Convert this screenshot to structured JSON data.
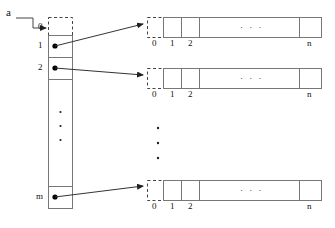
{
  "diagram": {
    "pointer_label": "a",
    "colors": {
      "stroke": "#555555",
      "dash": "#444444",
      "dot": "#000000",
      "text": "#111111"
    },
    "column": {
      "name": "row-pointer-column",
      "header_cell_label": "0",
      "index_labels": [
        "0",
        "1",
        "2",
        "m"
      ],
      "vertical_ellipsis": "·",
      "cells": [
        {
          "index": "0",
          "dashed": true,
          "has_pointer": false
        },
        {
          "index": "1",
          "dashed": false,
          "has_pointer": true
        },
        {
          "index": "2",
          "dashed": false,
          "has_pointer": true
        },
        {
          "index": "",
          "dashed": false,
          "has_pointer": false
        },
        {
          "index": "m",
          "dashed": false,
          "has_pointer": true
        }
      ]
    },
    "rows": [
      {
        "name": "row-array-1",
        "source_index": "1",
        "index_labels": [
          "0",
          "1",
          "2",
          "n"
        ],
        "leading_dashed_cell": true,
        "horizontal_ellipsis": "· · ·"
      },
      {
        "name": "row-array-2",
        "source_index": "2",
        "index_labels": [
          "0",
          "1",
          "2",
          "n"
        ],
        "leading_dashed_cell": true,
        "horizontal_ellipsis": "· · ·"
      },
      {
        "name": "row-array-m",
        "source_index": "m",
        "index_labels": [
          "0",
          "1",
          "2",
          "n"
        ],
        "leading_dashed_cell": true,
        "horizontal_ellipsis": "· · ·"
      }
    ],
    "middle_vertical_ellipsis": "·"
  }
}
